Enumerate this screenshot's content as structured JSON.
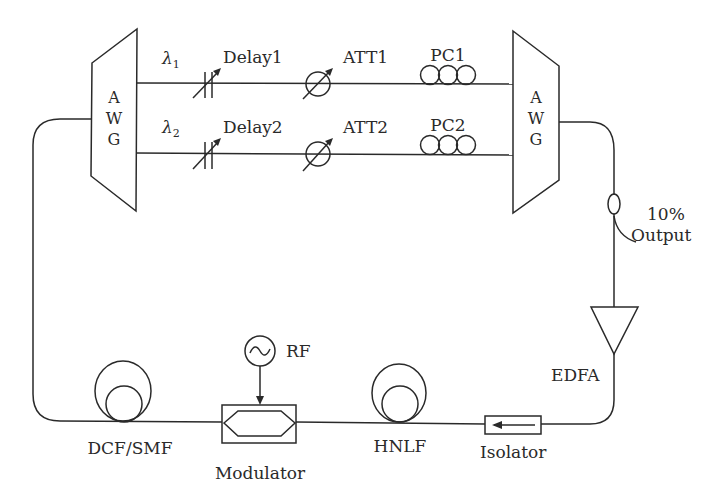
{
  "diagram": {
    "type": "fiber-ring-laser-setup",
    "components": {
      "awg_left": {
        "letters": [
          "A",
          "W",
          "G"
        ]
      },
      "awg_right": {
        "letters": [
          "A",
          "W",
          "G"
        ]
      },
      "lambda1": {
        "symbol": "λ",
        "subscript": "1"
      },
      "lambda2": {
        "symbol": "λ",
        "subscript": "2"
      },
      "delay1": "Delay1",
      "delay2": "Delay2",
      "att1": "ATT1",
      "att2": "ATT2",
      "pc1": "PC1",
      "pc2": "PC2",
      "coupler_ratio": "10%",
      "coupler_output": "Output",
      "edfa": "EDFA",
      "isolator": "Isolator",
      "hnlf": "HNLF",
      "modulator": "Modulator",
      "rf": "RF",
      "dcf_smf": "DCF/SMF"
    },
    "connections": [
      [
        "awg_left",
        "delay1"
      ],
      [
        "delay1",
        "att1"
      ],
      [
        "att1",
        "pc1"
      ],
      [
        "pc1",
        "awg_right"
      ],
      [
        "awg_left",
        "delay2"
      ],
      [
        "delay2",
        "att2"
      ],
      [
        "att2",
        "pc2"
      ],
      [
        "pc2",
        "awg_right"
      ],
      [
        "awg_right",
        "coupler"
      ],
      [
        "coupler",
        "edfa"
      ],
      [
        "edfa",
        "isolator"
      ],
      [
        "isolator",
        "hnlf"
      ],
      [
        "hnlf",
        "modulator"
      ],
      [
        "rf",
        "modulator"
      ],
      [
        "modulator",
        "dcf_smf"
      ],
      [
        "dcf_smf",
        "awg_left"
      ]
    ]
  }
}
